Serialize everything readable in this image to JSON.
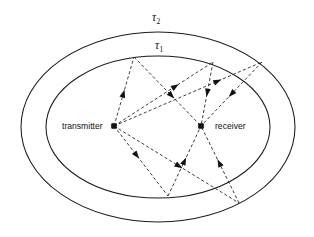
{
  "figure": {
    "type": "diagram",
    "background_color": "#ffffff",
    "line_color": "#1b1b1b",
    "width": 314,
    "height": 237
  },
  "labels": {
    "transmitter": "transmitter",
    "receiver": "receiver",
    "tau_outer_symbol": "τ",
    "tau_outer_subscript": "2",
    "tau_inner_symbol": "τ",
    "tau_inner_subscript": "1"
  },
  "nodes": [
    {
      "name": "transmitter",
      "label": "transmitter",
      "x": 114,
      "y": 126,
      "label_x": 62,
      "label_y": 129,
      "label_anchor": "start"
    },
    {
      "name": "receiver",
      "label": "receiver",
      "x": 201,
      "y": 126,
      "label_x": 215,
      "label_y": 129,
      "label_anchor": "start"
    }
  ],
  "ellipses": [
    {
      "name": "tau-2-ellipse",
      "label": "τ₂",
      "cx": 158,
      "cy": 127,
      "rx": 137,
      "ry": 95,
      "label_x": 152,
      "label_y": 21
    },
    {
      "name": "tau-1-ellipse",
      "label": "τ₁",
      "cx": 158,
      "cy": 127,
      "rx": 112,
      "ry": 71,
      "label_x": 155,
      "label_y": 49
    }
  ],
  "scatterers": [
    {
      "name": "scatterer-upper-left-inner",
      "x": 134,
      "y": 57,
      "on": "tau-1-ellipse"
    },
    {
      "name": "scatterer-upper-right-inner",
      "x": 213,
      "y": 62,
      "on": "tau-1-ellipse"
    },
    {
      "name": "scatterer-right-outer",
      "x": 262,
      "y": 62,
      "on": "tau-2-ellipse"
    },
    {
      "name": "scatterer-bottom-inner",
      "x": 168,
      "y": 196,
      "on": "tau-1-ellipse"
    },
    {
      "name": "scatterer-bottom-right-outer",
      "x": 239,
      "y": 203,
      "on": "tau-2-ellipse"
    }
  ],
  "rays": [
    {
      "name": "ray-tx-to-upper-left-inner",
      "from": "transmitter",
      "to": "scatterer-upper-left-inner",
      "arrow_t": 0.47,
      "arrow": true
    },
    {
      "name": "ray-upper-left-inner-to-rx",
      "from": "scatterer-upper-left-inner",
      "to": "receiver",
      "arrow_t": 0.56,
      "arrow": true
    },
    {
      "name": "ray-tx-to-upper-right-inner",
      "from": "transmitter",
      "to": "scatterer-upper-right-inner",
      "arrow_t": 0.62,
      "arrow": true
    },
    {
      "name": "ray-upper-right-inner-to-rx",
      "from": "scatterer-upper-right-inner",
      "to": "receiver",
      "arrow_t": 0.48,
      "arrow": true
    },
    {
      "name": "ray-tx-to-right-outer",
      "from": "transmitter",
      "to": "scatterer-right-outer",
      "arrow_t": 0.7,
      "arrow": true
    },
    {
      "name": "ray-right-outer-to-rx",
      "from": "scatterer-right-outer",
      "to": "receiver",
      "arrow_t": 0.5,
      "arrow": true
    },
    {
      "name": "ray-tx-to-bottom-inner",
      "from": "transmitter",
      "to": "scatterer-bottom-inner",
      "arrow_t": 0.42,
      "arrow": true
    },
    {
      "name": "ray-bottom-inner-to-rx",
      "from": "scatterer-bottom-inner",
      "to": "receiver",
      "arrow_t": 0.5,
      "arrow": true
    },
    {
      "name": "ray-tx-to-bottom-right-outer",
      "from": "transmitter",
      "to": "scatterer-bottom-right-outer",
      "arrow_t": 0.52,
      "arrow": true
    },
    {
      "name": "ray-bottom-right-outer-to-rx",
      "from": "scatterer-bottom-right-outer",
      "to": "receiver",
      "arrow_t": 0.52,
      "arrow": true
    }
  ]
}
